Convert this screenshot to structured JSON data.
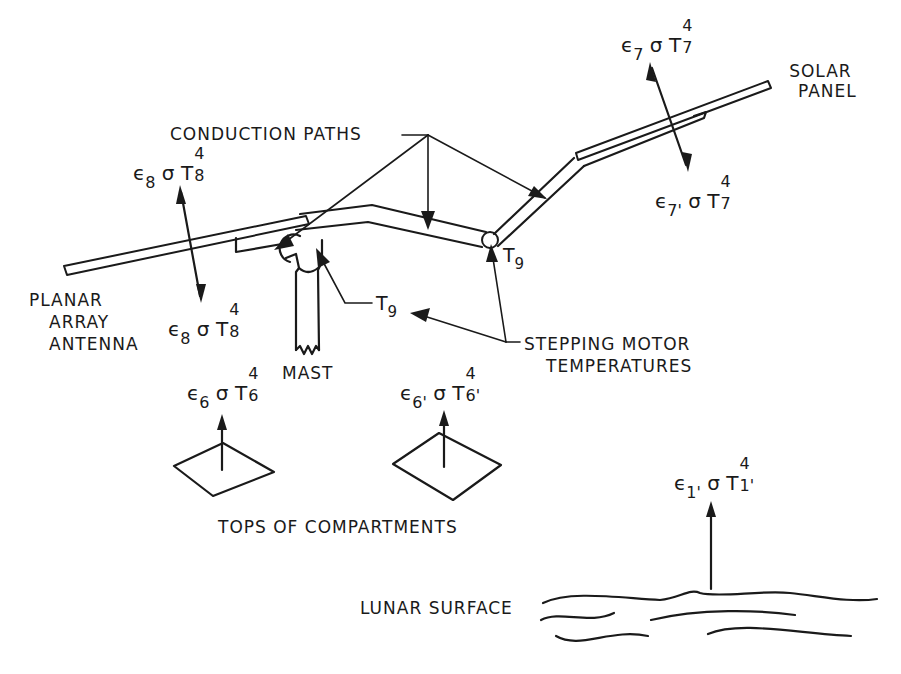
{
  "figure": {
    "type": "thermal-model-schematic",
    "labels": {
      "conduction_paths": "CONDUCTION PATHS",
      "solar_panel": [
        "SOLAR",
        "PANEL"
      ],
      "planar_array_antenna": [
        "PLANAR",
        "ARRAY",
        "ANTENNA"
      ],
      "mast": "MAST",
      "stepping_motor_temperatures": [
        "STEPPING MOTOR",
        "TEMPERATURES"
      ],
      "tops_of_compartments": "TOPS OF COMPARTMENTS",
      "lunar_surface": "LUNAR SURFACE"
    },
    "temperature_labels": {
      "t9_right": {
        "base": "T",
        "sub": "9"
      },
      "t9_mid": {
        "base": "T",
        "sub": "9"
      }
    },
    "radiation_terms": {
      "solar_panel_top": {
        "eps": "ϵ",
        "eps_sub": "7",
        "sigma": "σ",
        "T": "T",
        "sup": "4",
        "T_sub": "7"
      },
      "solar_panel_bottom": {
        "eps": "ϵ",
        "eps_sub": "7'",
        "sigma": "σ",
        "T": "T",
        "sup": "4",
        "T_sub": "7"
      },
      "antenna_top": {
        "eps": "ϵ",
        "eps_sub": "8",
        "sigma": "σ",
        "T": "T",
        "sup": "4",
        "T_sub": "8"
      },
      "antenna_bottom": {
        "eps": "ϵ",
        "eps_sub": "8",
        "sigma": "σ",
        "T": "T",
        "sup": "4",
        "T_sub": "8"
      },
      "compartment_6": {
        "eps": "ϵ",
        "eps_sub": "6",
        "sigma": "σ",
        "T": "T",
        "sup": "4",
        "T_sub": "6"
      },
      "compartment_6prime": {
        "eps": "ϵ",
        "eps_sub": "6'",
        "sigma": "σ",
        "T": "T",
        "sup": "4",
        "T_sub": "6'"
      },
      "lunar_surface": {
        "eps": "ϵ",
        "eps_sub": "1'",
        "sigma": "σ",
        "T": "T",
        "sup": "4",
        "T_sub": "1'"
      }
    },
    "colors": {
      "ink": "#1a1a1a",
      "background": "#ffffff"
    }
  }
}
